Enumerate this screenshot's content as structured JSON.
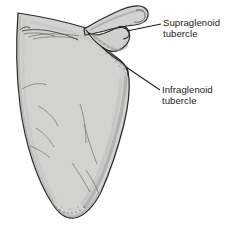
{
  "figure": {
    "type": "anatomical-illustration",
    "view": "lateral",
    "background_color": "#ffffff",
    "bone_fill_color": "#d2d2d0",
    "bone_shadow_color": "#b4b4b2",
    "outline_color": "#2a2a2a",
    "label_text_color": "#1b1b1b"
  },
  "labels": [
    {
      "id": "supraglenoid",
      "line1": "Supraglenoid",
      "line2": "tubercle",
      "leader": {
        "from_x": 127,
        "from_y": 31,
        "to_x": 161,
        "to_y": 24
      }
    },
    {
      "id": "infraglenoid",
      "line1": "Infraglenoid",
      "line2": "tubercle",
      "leader": {
        "from_x": 126,
        "from_y": 67,
        "to_x": 160,
        "to_y": 90
      }
    }
  ]
}
